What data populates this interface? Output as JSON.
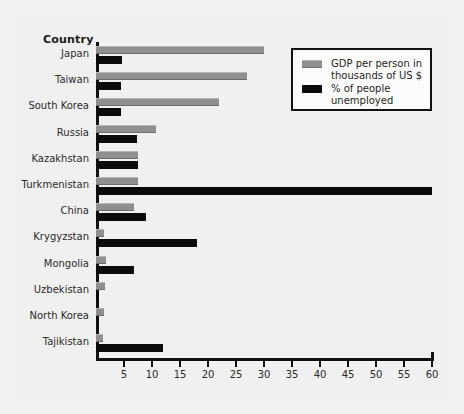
{
  "chart_data": {
    "type": "bar",
    "orientation": "horizontal",
    "title": "",
    "xlabel": "",
    "ylabel": "Country",
    "xlim": [
      0,
      60
    ],
    "xticks": [
      5,
      10,
      15,
      20,
      25,
      30,
      35,
      40,
      45,
      50,
      55,
      60
    ],
    "grid": false,
    "legend_position": "top-right",
    "categories": [
      "Japan",
      "Taiwan",
      "South Korea",
      "Russia",
      "Kazakhstan",
      "Turkmenistan",
      "China",
      "Krygyzstan",
      "Mongolia",
      "Uzbekistan",
      "North Korea",
      "Tajikistan"
    ],
    "series": [
      {
        "name": "GDP per person in thousands of US $",
        "color": "#8f8f8f",
        "values": [
          30,
          27,
          22,
          10.7,
          7.5,
          7.5,
          6.8,
          1.5,
          1.8,
          1.6,
          1.5,
          1.2
        ]
      },
      {
        "name": "% of people unemployed",
        "color": "#0b0b0b",
        "values": [
          4.6,
          4.5,
          4.4,
          7.3,
          7.5,
          60,
          9.0,
          18,
          6.8,
          0.5,
          0,
          12
        ]
      }
    ]
  },
  "axis_title": "Country",
  "legend": {
    "items": [
      {
        "label": "GDP per person in\nthousands of US $",
        "swatch": "gdp-swatch"
      },
      {
        "label": "% of people\nunemployed",
        "swatch": "unemployed-swatch"
      }
    ]
  }
}
